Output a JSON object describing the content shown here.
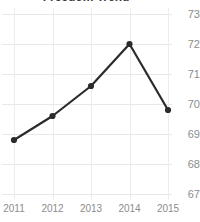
{
  "chart_data": {
    "type": "line",
    "title": "Freedom Trend",
    "xlabel": "",
    "ylabel": "",
    "categories": [
      "2011",
      "2012",
      "2013",
      "2014",
      "2015"
    ],
    "x": [
      2011,
      2012,
      2013,
      2014,
      2015
    ],
    "values": [
      68.8,
      69.6,
      70.6,
      72.0,
      69.8
    ],
    "series": [
      {
        "name": "Freedom Trend",
        "values": [
          68.8,
          69.6,
          70.6,
          72.0,
          69.8
        ]
      }
    ],
    "y_ticks": [
      73,
      72,
      71,
      70,
      69,
      68,
      67
    ],
    "y_tick_labels": [
      "73",
      "72",
      "71",
      "70",
      "69",
      "68",
      "67"
    ],
    "x_tick_labels": [
      "2011",
      "2012",
      "2013",
      "2014",
      "2015"
    ],
    "ylim": [
      67,
      73
    ],
    "xlim": [
      2011,
      2015
    ],
    "grid": true,
    "grid_axis": "both",
    "legend": false,
    "legend_position": "none",
    "y_axis_position": "right",
    "marker": "circle",
    "colors": {
      "line": "#2b2b2b",
      "marker": "#2b2b2b",
      "grid": "#e8e8e8",
      "tick_label": "#8c8c8c",
      "title": "#3c3c3c",
      "background": "#ffffff"
    }
  }
}
